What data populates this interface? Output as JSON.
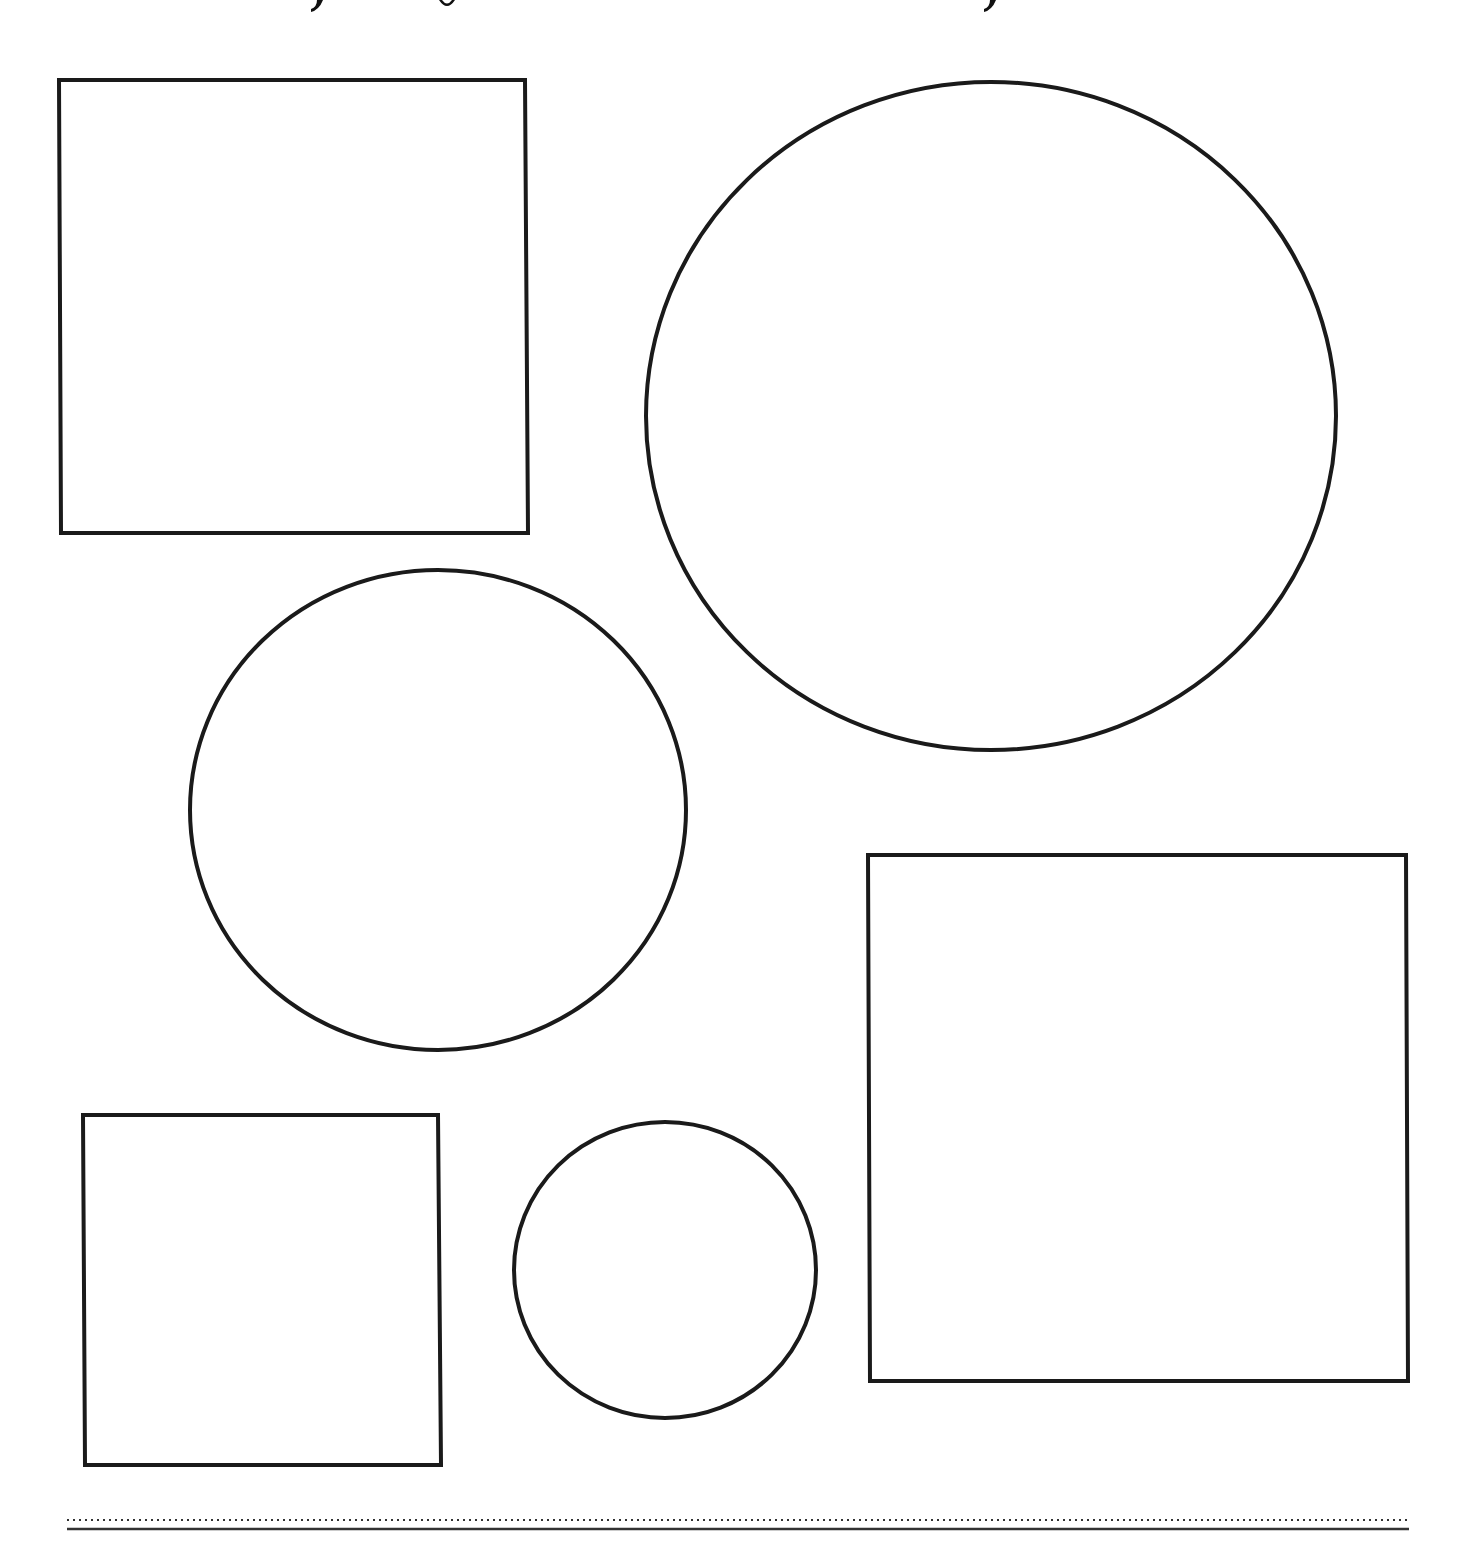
{
  "page": {
    "type": "worksheet",
    "title_visible": false,
    "title_note": "title text cut off at top edge; only descender fragments visible"
  },
  "colors": {
    "background": "#ffffff",
    "stroke": "#1a1a1a",
    "rule": "#333333"
  },
  "title_fragments": [
    {
      "x": 317,
      "glyph": "y-descender"
    },
    {
      "x": 447,
      "glyph": "g-descender"
    },
    {
      "x": 990,
      "glyph": "y-descender"
    }
  ],
  "shapes": [
    {
      "id": "square-top-left",
      "kind": "rectangle",
      "points": [
        [
          59,
          80
        ],
        [
          525,
          80
        ],
        [
          528,
          533
        ],
        [
          61,
          533
        ]
      ]
    },
    {
      "id": "circle-large-top-right",
      "kind": "ellipse",
      "cx": 991,
      "cy": 416,
      "rx": 345,
      "ry": 334
    },
    {
      "id": "circle-medium-left",
      "kind": "ellipse",
      "cx": 438,
      "cy": 810,
      "rx": 248,
      "ry": 240
    },
    {
      "id": "square-large-bottom-right",
      "kind": "rectangle",
      "points": [
        [
          868,
          855
        ],
        [
          1406,
          855
        ],
        [
          1408,
          1381
        ],
        [
          870,
          1381
        ]
      ]
    },
    {
      "id": "square-small-bottom-left",
      "kind": "rectangle",
      "points": [
        [
          83,
          1115
        ],
        [
          438,
          1115
        ],
        [
          441,
          1465
        ],
        [
          85,
          1465
        ]
      ]
    },
    {
      "id": "circle-small-bottom-center",
      "kind": "ellipse",
      "cx": 665,
      "cy": 1270,
      "rx": 151,
      "ry": 148
    }
  ],
  "footer_rules": {
    "dotted": {
      "x1": 67,
      "x2": 1409,
      "y": 1520
    },
    "solid": {
      "x1": 67,
      "x2": 1409,
      "y": 1529
    }
  }
}
